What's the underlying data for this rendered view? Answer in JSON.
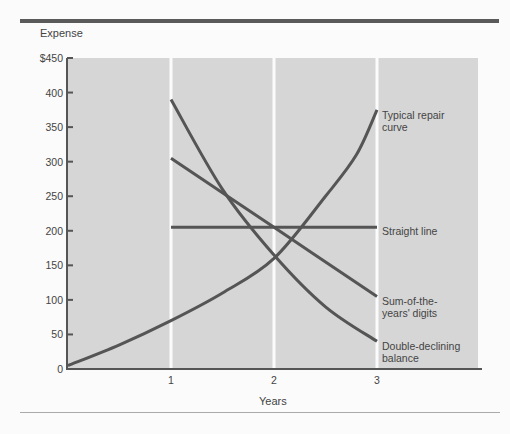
{
  "chart_data": {
    "type": "line",
    "title": "",
    "xlabel": "Years",
    "ylabel": "Expense",
    "x_ticks": [
      "1",
      "2",
      "3"
    ],
    "y_ticks": [
      "$450",
      "400",
      "350",
      "300",
      "250",
      "200",
      "150",
      "100",
      "50",
      "0"
    ],
    "xlim": [
      0,
      4
    ],
    "ylim": [
      0,
      450
    ],
    "grid": "vertical white lines at years 1, 2, 3",
    "legend_position": "inline right of year 3",
    "series": [
      {
        "name": "Typical repair curve",
        "x": [
          0,
          0.5,
          1,
          1.5,
          2,
          2.5,
          2.8,
          3
        ],
        "values": [
          5,
          35,
          70,
          110,
          160,
          250,
          310,
          375
        ]
      },
      {
        "name": "Straight line",
        "x": [
          1,
          2,
          3
        ],
        "values": [
          205,
          205,
          205
        ]
      },
      {
        "name": "Sum-of-the-years' digits",
        "x": [
          1,
          2,
          3
        ],
        "values": [
          305,
          205,
          105
        ]
      },
      {
        "name": "Double-declining balance",
        "x": [
          1,
          1.5,
          2,
          2.5,
          3
        ],
        "values": [
          390,
          260,
          165,
          90,
          40
        ]
      }
    ]
  },
  "labels": {
    "ylabel": "Expense",
    "xlabel": "Years",
    "repair_1": "Typical repair",
    "repair_2": "curve",
    "straight": "Straight line",
    "syd_1": "Sum-of-the-",
    "syd_2": "years' digits",
    "ddb_1": "Double-declining",
    "ddb_2": "balance"
  }
}
